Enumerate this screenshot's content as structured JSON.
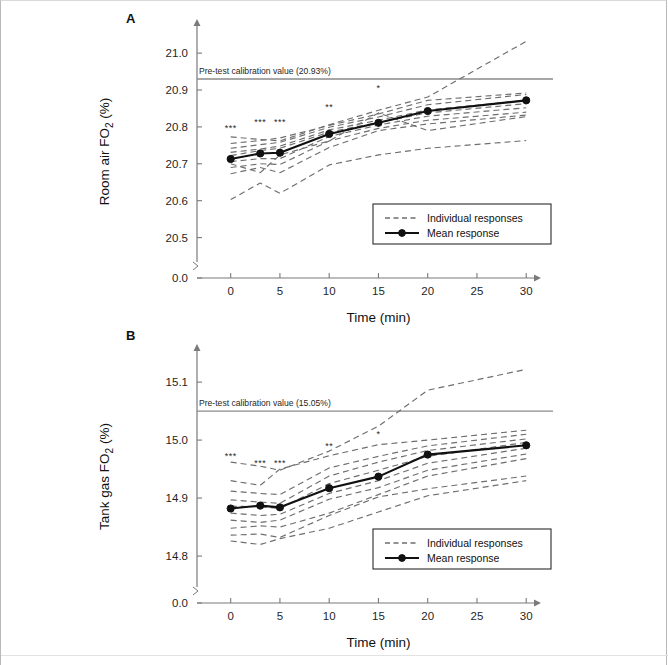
{
  "figure": {
    "background": "#ffffff",
    "panels": [
      "A",
      "B"
    ]
  },
  "chart_data": [
    {
      "type": "line",
      "panel": "A",
      "title": "",
      "xlabel": "Time (min)",
      "ylabel": "Room air FO2 (%)",
      "ylabel_parts": {
        "pre": "Room air FO",
        "sub": "2",
        "post": " (%)"
      },
      "x": [
        0,
        3,
        5,
        10,
        15,
        20,
        30
      ],
      "xlim": [
        -2.2,
        31.5
      ],
      "xticks": [
        0,
        5,
        10,
        15,
        20,
        25,
        30
      ],
      "xticklabels": [
        "0",
        "5",
        "10",
        "15",
        "20",
        "25",
        "30"
      ],
      "ylim": [
        20.45,
        21.06
      ],
      "yticks": [
        20.5,
        20.6,
        20.7,
        20.8,
        20.9,
        21.0
      ],
      "yticklabels": [
        "20.5",
        "20.6",
        "20.7",
        "20.8",
        "20.9",
        "21.0"
      ],
      "axis_break_label": "0.0",
      "grid": false,
      "calibration": {
        "value": 20.93,
        "label": "Pre-test calibration value (20.93%)"
      },
      "series": [
        {
          "name": "Mean response",
          "style": "solid-marker",
          "values": [
            20.713,
            20.728,
            20.73,
            20.781,
            20.811,
            20.843,
            20.872
          ]
        }
      ],
      "individual": {
        "name": "Individual responses",
        "style": "dashed",
        "curves": [
          [
            20.773,
            20.766,
            20.762,
            20.806,
            20.845,
            20.881,
            21.032
          ],
          [
            20.755,
            20.763,
            20.77,
            20.804,
            20.835,
            20.872,
            20.892
          ],
          [
            20.742,
            20.752,
            20.758,
            20.799,
            20.827,
            20.86,
            20.888
          ],
          [
            20.731,
            20.74,
            20.748,
            20.792,
            20.818,
            20.846,
            20.872
          ],
          [
            20.722,
            20.736,
            20.742,
            20.786,
            20.812,
            20.838,
            20.863
          ],
          [
            20.706,
            20.714,
            20.714,
            20.774,
            20.805,
            20.829,
            20.852
          ],
          [
            20.69,
            20.7,
            20.698,
            20.762,
            20.796,
            20.818,
            20.84
          ],
          [
            20.673,
            20.69,
            20.676,
            20.744,
            20.79,
            20.808,
            20.832
          ],
          [
            20.7,
            20.676,
            20.724,
            20.762,
            20.838,
            20.79,
            20.828
          ],
          [
            20.603,
            20.648,
            20.62,
            20.697,
            20.724,
            20.742,
            20.763
          ]
        ]
      },
      "significance": [
        {
          "x": 0,
          "label": "***",
          "y": 20.79
        },
        {
          "x": 3,
          "label": "***",
          "y": 20.805
        },
        {
          "x": 5,
          "label": "***",
          "y": 20.806
        },
        {
          "x": 10,
          "label": "**",
          "y": 20.845
        },
        {
          "x": 15,
          "label": "*",
          "y": 20.898
        }
      ],
      "legend": {
        "position": "bottom-right",
        "entries": [
          "Individual responses",
          "Mean response"
        ]
      }
    },
    {
      "type": "line",
      "panel": "B",
      "title": "",
      "xlabel": "Time (min)",
      "ylabel": "Tank gas FO2 (%)",
      "ylabel_parts": {
        "pre": "Tank gas FO",
        "sub": "2",
        "post": " (%)"
      },
      "x": [
        0,
        3,
        5,
        10,
        15,
        20,
        30
      ],
      "xlim": [
        -2.2,
        31.5
      ],
      "xticks": [
        0,
        5,
        10,
        15,
        20,
        25,
        30
      ],
      "xticklabels": [
        "0",
        "5",
        "10",
        "15",
        "20",
        "25",
        "30"
      ],
      "ylim": [
        14.757,
        15.145
      ],
      "yticks": [
        14.8,
        14.9,
        15.0,
        15.1
      ],
      "yticklabels": [
        "14.8",
        "14.9",
        "15.0",
        "15.1"
      ],
      "axis_break_label": "0.0",
      "grid": false,
      "calibration": {
        "value": 15.05,
        "label": "Pre-test calibration value (15.05%)"
      },
      "series": [
        {
          "name": "Mean response",
          "style": "solid-marker",
          "values": [
            14.882,
            14.887,
            14.884,
            14.917,
            14.937,
            14.975,
            14.991
          ]
        }
      ],
      "individual": {
        "name": "Individual responses",
        "style": "dashed",
        "curves": [
          [
            14.962,
            14.955,
            14.948,
            14.981,
            15.024,
            15.086,
            15.122
          ],
          [
            14.93,
            14.922,
            14.95,
            14.973,
            14.992,
            15.0,
            15.017
          ],
          [
            14.912,
            14.908,
            14.906,
            14.952,
            14.972,
            14.99,
            15.01
          ],
          [
            14.897,
            14.893,
            14.891,
            14.938,
            14.962,
            14.982,
            15.002
          ],
          [
            14.886,
            14.885,
            14.882,
            14.925,
            14.948,
            14.972,
            14.996
          ],
          [
            14.874,
            14.87,
            14.872,
            14.908,
            14.93,
            14.96,
            14.986
          ],
          [
            14.862,
            14.858,
            14.862,
            14.898,
            14.918,
            14.948,
            14.976
          ],
          [
            14.848,
            14.852,
            14.85,
            14.874,
            14.906,
            14.938,
            14.968
          ],
          [
            14.836,
            14.838,
            14.832,
            14.87,
            14.902,
            14.916,
            14.938
          ],
          [
            14.826,
            14.82,
            14.83,
            14.848,
            14.876,
            14.904,
            14.93
          ]
        ]
      },
      "significance": [
        {
          "x": 0,
          "label": "***",
          "y": 14.967
        },
        {
          "x": 3,
          "label": "***",
          "y": 14.955
        },
        {
          "x": 5,
          "label": "***",
          "y": 14.955
        },
        {
          "x": 10,
          "label": "**",
          "y": 14.984
        },
        {
          "x": 15,
          "label": "*",
          "y": 15.006
        }
      ],
      "legend": {
        "position": "bottom-right",
        "entries": [
          "Individual responses",
          "Mean response"
        ]
      }
    }
  ]
}
